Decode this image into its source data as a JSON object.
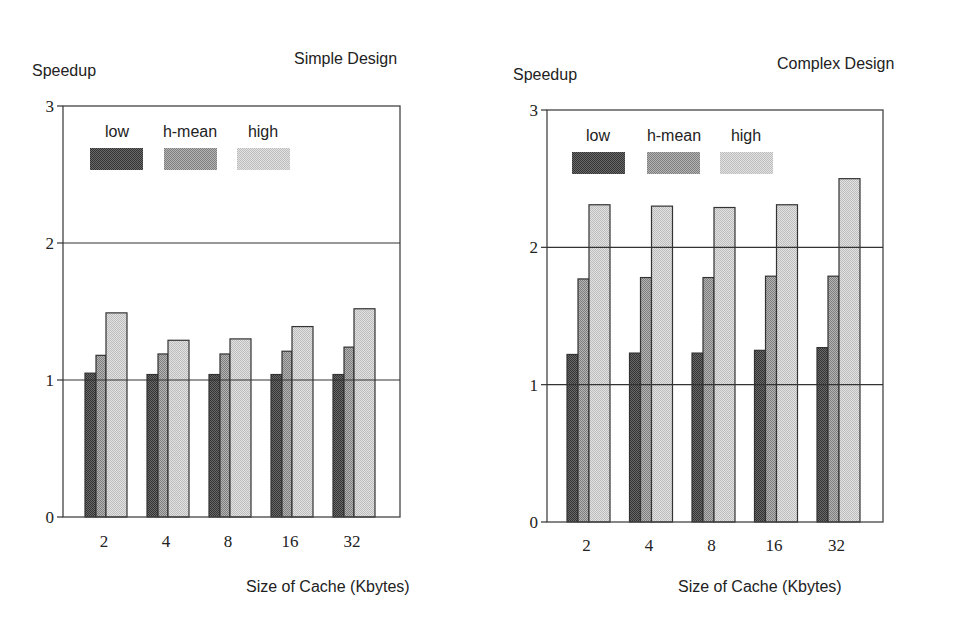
{
  "chart_data": [
    {
      "type": "bar",
      "title": "Simple Design",
      "xlabel": "Size of Cache (Kbytes)",
      "ylabel": "Speedup",
      "categories": [
        "2",
        "4",
        "8",
        "16",
        "32"
      ],
      "series": [
        {
          "name": "low",
          "values": [
            1.05,
            1.04,
            1.04,
            1.04,
            1.04
          ],
          "color": "#555555"
        },
        {
          "name": "h-mean",
          "values": [
            1.18,
            1.19,
            1.19,
            1.21,
            1.24
          ],
          "color": "#9a9a9a"
        },
        {
          "name": "high",
          "values": [
            1.49,
            1.29,
            1.3,
            1.39,
            1.52
          ],
          "color": "#d0d0d0"
        }
      ],
      "yticks": [
        "0",
        "1",
        "2",
        "3"
      ],
      "ylim": [
        0,
        3
      ],
      "grid": "horizontal lines at 1 and 2",
      "legend_position": "top-left inside plot"
    },
    {
      "type": "bar",
      "title": "Complex Design",
      "xlabel": "Size of Cache (Kbytes)",
      "ylabel": "Speedup",
      "categories": [
        "2",
        "4",
        "8",
        "16",
        "32"
      ],
      "series": [
        {
          "name": "low",
          "values": [
            1.22,
            1.23,
            1.23,
            1.25,
            1.27
          ],
          "color": "#555555"
        },
        {
          "name": "h-mean",
          "values": [
            1.77,
            1.78,
            1.78,
            1.79,
            1.79
          ],
          "color": "#9a9a9a"
        },
        {
          "name": "high",
          "values": [
            2.31,
            2.3,
            2.29,
            2.31,
            2.5
          ],
          "color": "#d0d0d0"
        }
      ],
      "yticks": [
        "0",
        "1",
        "2",
        "3"
      ],
      "ylim": [
        0,
        3
      ],
      "grid": "horizontal lines at 1 and 2",
      "legend_position": "top-left inside plot"
    }
  ],
  "layout": [
    {
      "plot": {
        "x0": 63,
        "x1": 400,
        "y0": 517,
        "y3": 106
      },
      "first_group_x": 85,
      "group_spacing": 62,
      "bar_widths": [
        11,
        10,
        21
      ],
      "ylabel_pos": {
        "x": 32,
        "y": 76
      },
      "title_pos": {
        "x": 294,
        "y": 64
      },
      "xlabel_pos": {
        "x": 246,
        "y": 592
      },
      "xtick_y": 547,
      "legend": {
        "label_y": 137,
        "box_y": 148,
        "box_h": 22,
        "boxes_x": [
          90,
          164,
          237
        ],
        "box_w": 53,
        "labels_x": [
          117,
          190,
          263
        ]
      }
    },
    {
      "plot": {
        "x0": 547,
        "x1": 883,
        "y0": 522,
        "y3": 110
      },
      "first_group_x": 567,
      "group_spacing": 62.5,
      "bar_widths": [
        11,
        11,
        21
      ],
      "ylabel_pos": {
        "x": 513,
        "y": 80
      },
      "title_pos": {
        "x": 777,
        "y": 69
      },
      "xlabel_pos": {
        "x": 678,
        "y": 592
      },
      "xtick_y": 551,
      "legend": {
        "label_y": 141,
        "box_y": 152,
        "box_h": 22,
        "boxes_x": [
          572,
          647,
          720
        ],
        "box_w": 53,
        "labels_x": [
          598,
          674,
          746
        ]
      }
    }
  ]
}
